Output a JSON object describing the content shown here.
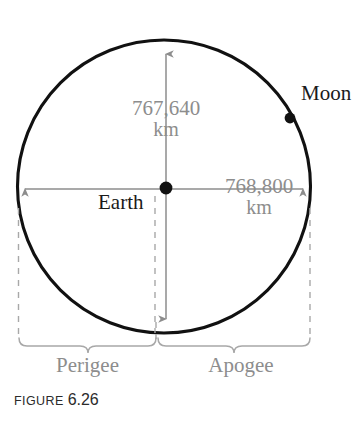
{
  "figure": {
    "caption_word": "FIGURE",
    "caption_number": "6.26",
    "labels": {
      "central_body": "Earth",
      "orbiting_body": "Moon",
      "left_region": "Perigee",
      "right_region": "Apogee"
    },
    "dimensions": {
      "vertical": {
        "value": "767,640",
        "unit": "km"
      },
      "horizontal": {
        "value": "768,800",
        "unit": "km"
      }
    },
    "colors": {
      "orbit_stroke": "#111111",
      "dimension_gray": "#8d8d8d",
      "label_dark": "#1a1a1a",
      "dashed_gray": "#a8a8a8",
      "background": "#ffffff"
    },
    "icons": {
      "earth_marker": "filled-circle-dot",
      "moon_marker": "filled-circle-dot",
      "vertical_dimension": "double-headed-arrow-vertical",
      "horizontal_dimension": "double-headed-arrow-horizontal",
      "left_brace": "curly-brace-down",
      "right_brace": "curly-brace-down"
    }
  }
}
